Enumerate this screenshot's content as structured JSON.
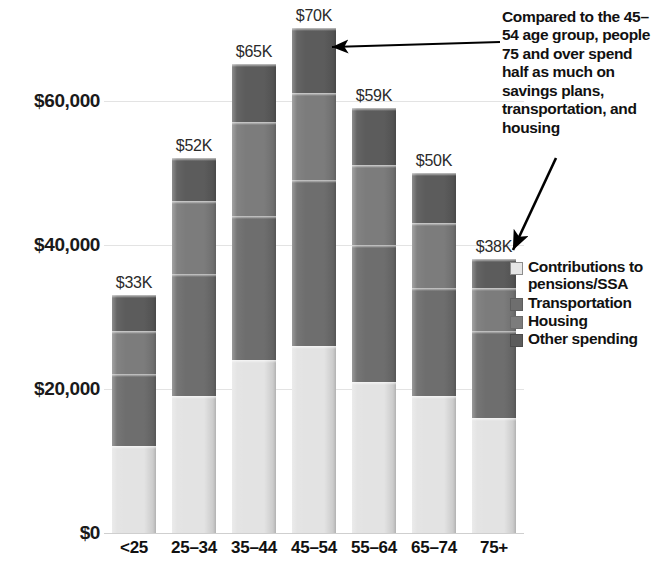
{
  "chart_data": {
    "type": "bar",
    "subtype": "stacked-bar",
    "title": "",
    "xlabel": "",
    "ylabel": "",
    "ylim": [
      0,
      72000
    ],
    "grid": true,
    "legend_position": "right",
    "categories": [
      "<25",
      "25–34",
      "35–44",
      "45–54",
      "55–64",
      "65–74",
      "75+"
    ],
    "totals": [
      33000,
      52000,
      65000,
      70000,
      59000,
      50000,
      38000
    ],
    "total_labels": [
      "$33K",
      "$52K",
      "$65K",
      "$70K",
      "$59K",
      "$50K",
      "$38K"
    ],
    "yticks": [
      0,
      20000,
      40000,
      60000
    ],
    "ytick_labels": [
      "$0",
      "$20,000",
      "$40,000",
      "$60,000"
    ],
    "series": [
      {
        "name": "Other spending",
        "color": "#5c5c5c",
        "values": [
          12000,
          19000,
          24000,
          26000,
          21000,
          19000,
          16000
        ]
      },
      {
        "name": "Housing",
        "color": "#7c7c7c",
        "values": [
          10000,
          17000,
          20000,
          23000,
          19000,
          15000,
          12000
        ]
      },
      {
        "name": "Transportation",
        "color": "#6e6e6e",
        "values": [
          6000,
          10000,
          13000,
          12000,
          11000,
          9000,
          6000
        ]
      },
      {
        "name": "Contributions to pensions/SSA",
        "color": "#e3e3e3",
        "values": [
          5000,
          6000,
          8000,
          9000,
          8000,
          7000,
          4000
        ]
      }
    ],
    "annotations": [
      {
        "text": "Compared to the 45–54 age group, people 75 and over spend half as much on savings plans, transportation, and housing",
        "points_to": [
          "45–54",
          "75+"
        ]
      }
    ]
  },
  "legend": {
    "items": [
      {
        "label": "Contributions to\npensions/SSA",
        "swatch": "legend-swatch-contributions"
      },
      {
        "label": "Transportation",
        "swatch": "legend-swatch-transportation"
      },
      {
        "label": "Housing",
        "swatch": "legend-swatch-housing"
      },
      {
        "label": "Other spending",
        "swatch": "legend-swatch-other"
      }
    ]
  },
  "annotation": {
    "text": "Compared to the 45–54 age group, people 75 and over spend half as much on savings plans, transportation, and housing"
  }
}
